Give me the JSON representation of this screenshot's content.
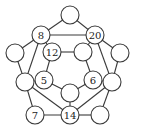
{
  "diagram": {
    "type": "graph",
    "node_radius": 9,
    "stroke_color": "#3a3a3a",
    "nodes": [
      {
        "id": "top",
        "x": 70,
        "y": 15,
        "label": ""
      },
      {
        "id": "n8",
        "x": 41,
        "y": 35,
        "label": "8"
      },
      {
        "id": "n20",
        "x": 95,
        "y": 35,
        "label": "20"
      },
      {
        "id": "left_outer",
        "x": 15,
        "y": 53,
        "label": ""
      },
      {
        "id": "right_outer",
        "x": 120,
        "y": 53,
        "label": ""
      },
      {
        "id": "n12",
        "x": 52,
        "y": 52,
        "label": "12"
      },
      {
        "id": "inner_r",
        "x": 83,
        "y": 52,
        "label": ""
      },
      {
        "id": "n5",
        "x": 44,
        "y": 80,
        "label": "5"
      },
      {
        "id": "n6",
        "x": 93,
        "y": 80,
        "label": "6"
      },
      {
        "id": "left_lower",
        "x": 25,
        "y": 82,
        "label": ""
      },
      {
        "id": "right_lower",
        "x": 112,
        "y": 82,
        "label": ""
      },
      {
        "id": "center",
        "x": 70,
        "y": 93,
        "label": ""
      },
      {
        "id": "n7",
        "x": 35,
        "y": 115,
        "label": "7"
      },
      {
        "id": "n14",
        "x": 70,
        "y": 115,
        "label": "14"
      },
      {
        "id": "bottom_right",
        "x": 100,
        "y": 115,
        "label": ""
      }
    ],
    "edges": [
      [
        "top",
        "n8"
      ],
      [
        "top",
        "n20"
      ],
      [
        "n8",
        "n20"
      ],
      [
        "n8",
        "n12"
      ],
      [
        "n8",
        "left_outer"
      ],
      [
        "n8",
        "left_lower"
      ],
      [
        "n20",
        "inner_r"
      ],
      [
        "n20",
        "right_outer"
      ],
      [
        "n20",
        "right_lower"
      ],
      [
        "n12",
        "inner_r"
      ],
      [
        "n12",
        "n5"
      ],
      [
        "inner_r",
        "n6"
      ],
      [
        "n5",
        "center"
      ],
      [
        "n6",
        "center"
      ],
      [
        "center",
        "n14"
      ],
      [
        "n5",
        "left_lower"
      ],
      [
        "n6",
        "right_lower"
      ],
      [
        "left_outer",
        "left_lower"
      ],
      [
        "right_outer",
        "right_lower"
      ],
      [
        "left_lower",
        "n7"
      ],
      [
        "left_lower",
        "n14"
      ],
      [
        "n7",
        "n14"
      ],
      [
        "right_lower",
        "n14"
      ],
      [
        "right_lower",
        "bottom_right"
      ],
      [
        "n14",
        "bottom_right"
      ]
    ]
  }
}
